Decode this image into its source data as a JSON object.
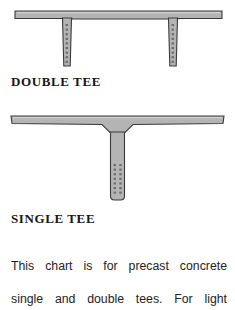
{
  "page": {
    "background_color": "#ffffff",
    "width": 235,
    "height": 300
  },
  "figures": [
    {
      "id": "double-tee",
      "caption": "DOUBLE TEE",
      "description": "Cross-section of a precast concrete double tee beam: one wide horizontal flange with two vertical stems, each stem containing a single vertical column of prestressing strand dots.",
      "fill_color": "#b4b4b4",
      "stroke_color": "#3a3a3a",
      "strand_dot_color": "#6e6e6e",
      "stem_count": 2,
      "strand_columns_per_stem": 1,
      "strand_rows_per_stem": 9
    },
    {
      "id": "single-tee",
      "caption": "SINGLE TEE",
      "description": "Cross-section of a precast concrete single tee beam: one wide horizontal flange tapering into one central vertical stem with two columns of prestressing strand dots near the bottom.",
      "fill_color": "#b4b4b4",
      "stroke_color": "#3a3a3a",
      "strand_dot_color": "#6e6e6e",
      "stem_count": 1,
      "strand_columns_per_stem": 2,
      "strand_rows_per_stem": 8
    }
  ],
  "body_text": {
    "line_1": "This chart is for precast concrete",
    "line_2": "single and double tees. For light",
    "full": "This chart is for precast concrete single and double tees. For light"
  }
}
